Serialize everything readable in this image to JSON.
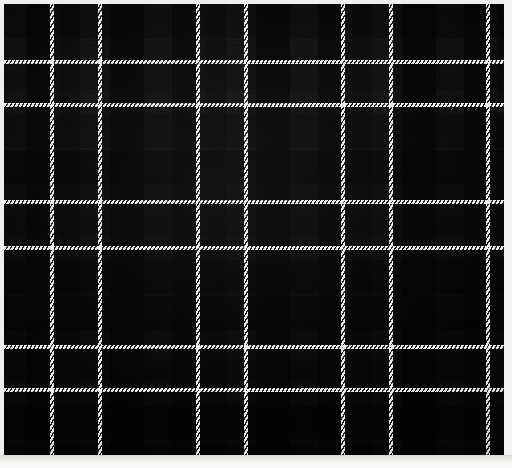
{
  "image": {
    "title": "Tartan Fabric Swatch",
    "subject": "black-and-grey plaid woven wool",
    "width": 512,
    "height": 468
  },
  "swatch": {
    "name": "tartan-swatch",
    "x": 4,
    "y": 4,
    "width": 500,
    "height": 452,
    "weave": "2/2 twill",
    "twill_angle_deg": -58
  },
  "palette": {
    "black": "#050505",
    "charcoal": "#141414",
    "dark_grey": "#242424",
    "mid_grey": "#343434",
    "light_grey": "#3e3e3e",
    "guard_white": "#f6f6f4",
    "backing": "#ededea",
    "bottom_strip": "#f4f4f2"
  },
  "sett": {
    "repeat_px": 146,
    "description": "paired white guard lines separated by 48px, repeat every 146px",
    "warp_guard_positions": [
      52,
      100,
      198,
      246,
      343,
      391,
      488
    ],
    "weft_guard_positions": [
      62,
      105,
      202,
      248,
      347,
      390
    ],
    "guard_width_px": 4
  },
  "warp_bands": [
    {
      "x": 0,
      "w": 22,
      "color": "#2e2e2e"
    },
    {
      "x": 22,
      "w": 26,
      "color": "#101010"
    },
    {
      "x": 48,
      "w": 8,
      "color": "#2a2a2a"
    },
    {
      "x": 56,
      "w": 20,
      "color": "#1e1e1e"
    },
    {
      "x": 76,
      "w": 22,
      "color": "#343434"
    },
    {
      "x": 98,
      "w": 8,
      "color": "#2a2a2a"
    },
    {
      "x": 106,
      "w": 34,
      "color": "#0a0a0a"
    },
    {
      "x": 140,
      "w": 26,
      "color": "#2b2b2b"
    },
    {
      "x": 166,
      "w": 28,
      "color": "#0b0b0b"
    },
    {
      "x": 194,
      "w": 8,
      "color": "#2a2a2a"
    },
    {
      "x": 202,
      "w": 20,
      "color": "#1e1e1e"
    },
    {
      "x": 222,
      "w": 22,
      "color": "#343434"
    },
    {
      "x": 244,
      "w": 8,
      "color": "#2a2a2a"
    },
    {
      "x": 252,
      "w": 34,
      "color": "#0a0a0a"
    },
    {
      "x": 286,
      "w": 26,
      "color": "#2b2b2b"
    },
    {
      "x": 312,
      "w": 28,
      "color": "#0b0b0b"
    },
    {
      "x": 340,
      "w": 8,
      "color": "#2a2a2a"
    },
    {
      "x": 348,
      "w": 20,
      "color": "#1e1e1e"
    },
    {
      "x": 368,
      "w": 22,
      "color": "#343434"
    },
    {
      "x": 390,
      "w": 8,
      "color": "#2a2a2a"
    },
    {
      "x": 398,
      "w": 34,
      "color": "#0a0a0a"
    },
    {
      "x": 432,
      "w": 26,
      "color": "#2b2b2b"
    },
    {
      "x": 458,
      "w": 28,
      "color": "#0b0b0b"
    },
    {
      "x": 486,
      "w": 8,
      "color": "#2a2a2a"
    },
    {
      "x": 494,
      "w": 16,
      "color": "#1e1e1e"
    }
  ],
  "weft_bands": [
    {
      "y": 0,
      "h": 34,
      "color": "#0c0c0c"
    },
    {
      "y": 34,
      "h": 24,
      "color": "#2e2e2e"
    },
    {
      "y": 58,
      "h": 8,
      "color": "#2a2a2a"
    },
    {
      "y": 66,
      "h": 20,
      "color": "#1f1f1f"
    },
    {
      "y": 86,
      "h": 16,
      "color": "#343434"
    },
    {
      "y": 102,
      "h": 8,
      "color": "#2a2a2a"
    },
    {
      "y": 110,
      "h": 34,
      "color": "#0a0a0a"
    },
    {
      "y": 144,
      "h": 26,
      "color": "#2b2b2b"
    },
    {
      "y": 170,
      "h": 28,
      "color": "#0b0b0b"
    },
    {
      "y": 198,
      "h": 8,
      "color": "#2a2a2a"
    },
    {
      "y": 206,
      "h": 20,
      "color": "#1f1f1f"
    },
    {
      "y": 226,
      "h": 18,
      "color": "#343434"
    },
    {
      "y": 244,
      "h": 8,
      "color": "#2a2a2a"
    },
    {
      "y": 252,
      "h": 34,
      "color": "#0a0a0a"
    },
    {
      "y": 286,
      "h": 28,
      "color": "#2b2b2b"
    },
    {
      "y": 314,
      "h": 29,
      "color": "#0b0b0b"
    },
    {
      "y": 343,
      "h": 8,
      "color": "#2a2a2a"
    },
    {
      "y": 351,
      "h": 20,
      "color": "#1f1f1f"
    },
    {
      "y": 371,
      "h": 16,
      "color": "#343434"
    },
    {
      "y": 387,
      "h": 8,
      "color": "#2a2a2a"
    },
    {
      "y": 395,
      "h": 34,
      "color": "#0a0a0a"
    },
    {
      "y": 429,
      "h": 25,
      "color": "#2b2b2b"
    }
  ]
}
